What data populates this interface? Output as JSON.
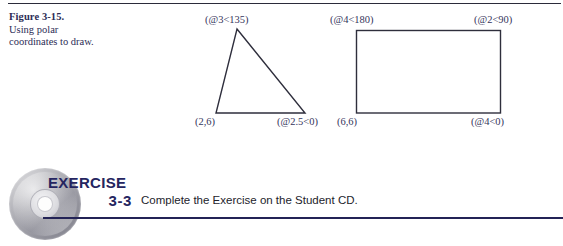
{
  "figure": {
    "caption_title": "Figure 3-15.",
    "caption_line1": "Using polar",
    "caption_line2": "coordinates to draw.",
    "shapes": {
      "triangle": {
        "apex_label": "(@3<135)",
        "bottom_left_label": "(2,6)",
        "bottom_right_label": "(@2.5<0)"
      },
      "rectangle": {
        "top_left_label": "(@4<180)",
        "top_right_label": "(@2<90)",
        "bottom_left_label": "(6,6)",
        "bottom_right_label": "(@4<0)"
      }
    }
  },
  "exercise": {
    "badge_word": "EXERCISE",
    "badge_number": "3-3",
    "instruction": "Complete the Exercise on the Student CD.",
    "icon": "compact-disc-icon"
  },
  "colors": {
    "rule_top": "#2b2b3a",
    "rule_bottom": "#232356",
    "caption_text": "#2c2c55",
    "label_text": "#35355c",
    "badge_text": "#252560",
    "shape_stroke": "#2e2e3c",
    "background": "#ffffff"
  }
}
